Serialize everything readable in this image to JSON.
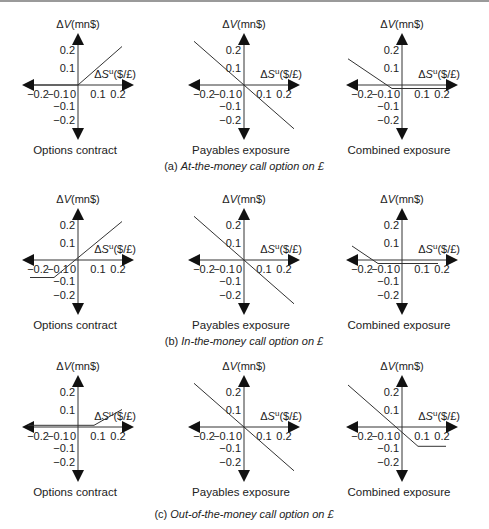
{
  "figure": {
    "x_axis_label_prefix": "ΔS",
    "x_axis_label_sup": "u",
    "x_axis_label_unit": "($/£)",
    "y_axis_label_prefix": "Δ",
    "y_axis_label_var": "V",
    "y_axis_label_unit": "(mn$)",
    "x_ticks": [
      "−0.2",
      "−0.1",
      "0",
      "0.1",
      "0.2"
    ],
    "y_ticks": [
      "0.2",
      "0.1",
      "−0.1",
      "−0.2"
    ],
    "rows": [
      {
        "caption_prefix": "(a) ",
        "caption_text": "At-the-money call option on £",
        "panels": [
          {
            "title": "Options contract",
            "line": [
              [
                -0.22,
                0.0
              ],
              [
                0.0,
                0.0
              ],
              [
                0.22,
                0.22
              ]
            ]
          },
          {
            "title": "Payables exposure",
            "line": [
              [
                -0.25,
                0.25
              ],
              [
                0.25,
                -0.25
              ]
            ]
          },
          {
            "title": "Combined exposure",
            "line": [
              [
                -0.27,
                0.15
              ],
              [
                -0.05,
                -0.02
              ],
              [
                0.22,
                -0.02
              ]
            ]
          }
        ]
      },
      {
        "caption_prefix": "(b) ",
        "caption_text": "In-the-money call option on £",
        "panels": [
          {
            "title": "Options contract",
            "line": [
              [
                -0.24,
                -0.1
              ],
              [
                -0.12,
                -0.1
              ],
              [
                0.22,
                0.22
              ]
            ]
          },
          {
            "title": "Payables exposure",
            "line": [
              [
                -0.25,
                0.25
              ],
              [
                0.25,
                -0.25
              ]
            ]
          },
          {
            "title": "Combined exposure",
            "line": [
              [
                -0.25,
                0.08
              ],
              [
                -0.12,
                -0.02
              ],
              [
                0.18,
                -0.02
              ]
            ]
          }
        ]
      },
      {
        "caption_prefix": "(c) ",
        "caption_text": "Out-of-the-money call option on £",
        "panels": [
          {
            "title": "Options contract",
            "line": [
              [
                -0.25,
                0.01
              ],
              [
                0.08,
                0.01
              ],
              [
                0.22,
                0.1
              ]
            ]
          },
          {
            "title": "Payables exposure",
            "line": [
              [
                -0.25,
                0.25
              ],
              [
                0.25,
                -0.25
              ]
            ]
          },
          {
            "title": "Combined exposure",
            "line": [
              [
                -0.27,
                0.24
              ],
              [
                0.08,
                -0.11
              ],
              [
                0.22,
                -0.11
              ]
            ]
          }
        ]
      }
    ]
  },
  "chart_data": [
    {
      "type": "line",
      "title": "(a) At-the-money call option on £",
      "panels": [
        {
          "name": "Options contract",
          "x": [
            -0.2,
            0,
            0.2
          ],
          "y": [
            0,
            0,
            0.2
          ]
        },
        {
          "name": "Payables exposure",
          "x": [
            -0.2,
            0,
            0.2
          ],
          "y": [
            0.2,
            0,
            -0.2
          ]
        },
        {
          "name": "Combined exposure",
          "x": [
            -0.2,
            0,
            0.2
          ],
          "y": [
            0.2,
            0,
            0
          ]
        }
      ],
      "xlabel": "ΔS^u($/£)",
      "ylabel": "ΔV(mn$)",
      "xlim": [
        -0.2,
        0.2
      ],
      "ylim": [
        -0.2,
        0.2
      ]
    },
    {
      "type": "line",
      "title": "(b) In-the-money call option on £",
      "panels": [
        {
          "name": "Options contract",
          "x": [
            -0.2,
            -0.1,
            0.2
          ],
          "y": [
            -0.1,
            -0.1,
            0.2
          ]
        },
        {
          "name": "Payables exposure",
          "x": [
            -0.2,
            0,
            0.2
          ],
          "y": [
            0.2,
            0,
            -0.2
          ]
        },
        {
          "name": "Combined exposure",
          "x": [
            -0.2,
            -0.1,
            0.2
          ],
          "y": [
            0.1,
            0,
            0
          ]
        }
      ],
      "xlabel": "ΔS^u($/£)",
      "ylabel": "ΔV(mn$)",
      "xlim": [
        -0.2,
        0.2
      ],
      "ylim": [
        -0.2,
        0.2
      ]
    },
    {
      "type": "line",
      "title": "(c) Out-of-the-money call option on £",
      "panels": [
        {
          "name": "Options contract",
          "x": [
            -0.2,
            0.1,
            0.2
          ],
          "y": [
            0,
            0,
            0.1
          ]
        },
        {
          "name": "Payables exposure",
          "x": [
            -0.2,
            0,
            0.2
          ],
          "y": [
            0.2,
            0,
            -0.2
          ]
        },
        {
          "name": "Combined exposure",
          "x": [
            -0.2,
            0.1,
            0.2
          ],
          "y": [
            0.2,
            -0.1,
            -0.1
          ]
        }
      ],
      "xlabel": "ΔS^u($/£)",
      "ylabel": "ΔV(mn$)",
      "xlim": [
        -0.2,
        0.2
      ],
      "ylim": [
        -0.2,
        0.2
      ]
    }
  ]
}
